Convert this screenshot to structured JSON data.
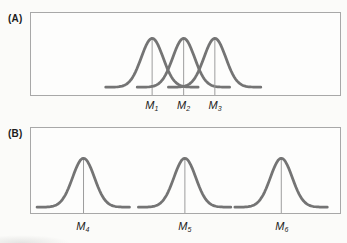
{
  "figure": {
    "colors": {
      "curve": "#747474",
      "box_border": "#a8a8a8",
      "mean_line": "#9b9b9b",
      "text": "#1c1c1c",
      "background": "#fbfbf9"
    },
    "panels": [
      {
        "id": "A",
        "label": "(A)",
        "curves": [
          {
            "label_main": "M",
            "label_sub": "1",
            "mean_frac": 0.392
          },
          {
            "label_main": "M",
            "label_sub": "2",
            "mean_frac": 0.494
          },
          {
            "label_main": "M",
            "label_sub": "3",
            "mean_frac": 0.595
          }
        ]
      },
      {
        "id": "B",
        "label": "(B)",
        "curves": [
          {
            "label_main": "M",
            "label_sub": "4",
            "mean_frac": 0.17
          },
          {
            "label_main": "M",
            "label_sub": "5",
            "mean_frac": 0.498
          },
          {
            "label_main": "M",
            "label_sub": "6",
            "mean_frac": 0.81
          }
        ]
      }
    ]
  }
}
